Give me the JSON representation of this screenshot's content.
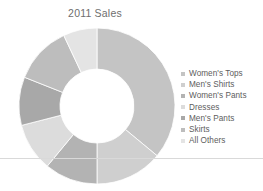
{
  "chart_data": {
    "type": "pie",
    "variant": "donut",
    "title": "2011 Sales",
    "xlabel": "",
    "ylabel": "",
    "legend_position": "right",
    "grid": false,
    "categories": [
      "Women's Tops",
      "Men's Shirts",
      "Women's Pants",
      "Dresses",
      "Men's Pants",
      "Skirts",
      "All Others"
    ],
    "values": [
      36,
      14,
      11,
      10,
      10,
      12,
      7
    ],
    "unit": "percent",
    "colors": [
      "#c4c4c4",
      "#cfcfcf",
      "#b3b3b3",
      "#dcdcdc",
      "#a8a8a8",
      "#bdbdbd",
      "#e4e4e4"
    ],
    "slices": [
      {
        "label": "Women's Tops",
        "value": 36,
        "color": "#c4c4c4"
      },
      {
        "label": "Men's Shirts",
        "value": 14,
        "color": "#cfcfcf"
      },
      {
        "label": "Women's Pants",
        "value": 11,
        "color": "#b3b3b3"
      },
      {
        "label": "Dresses",
        "value": 10,
        "color": "#dcdcdc"
      },
      {
        "label": "Men's Pants",
        "value": 10,
        "color": "#a8a8a8"
      },
      {
        "label": "Skirts",
        "value": 12,
        "color": "#bdbdbd"
      },
      {
        "label": "All Others",
        "value": 7,
        "color": "#e4e4e4"
      }
    ],
    "geometry": {
      "center_x": 97,
      "center_y": 106,
      "outer_radius": 78,
      "inner_radius": 37,
      "start_angle_deg": -90,
      "direction": "clockwise"
    }
  },
  "divider": {
    "color": "#d9d9d9",
    "y": 158
  },
  "title_color": "#6e6e6e",
  "legend_text_color": "#5d5d5d",
  "background": "#ffffff"
}
